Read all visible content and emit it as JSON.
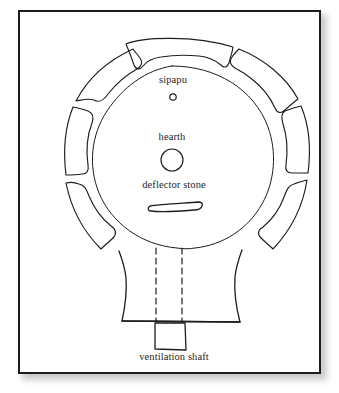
{
  "figure": {
    "kind": "archaeological-floor-plan",
    "background_color": "#ffffff",
    "ink_color": "#1d1d1d",
    "frame_color": "#1d1d1d"
  },
  "labels": {
    "sipapu": "sipapu",
    "hearth": "hearth",
    "deflector_stone": "deflector stone",
    "ventilation_shaft": "ventilation shaft"
  },
  "features": [
    {
      "id": "sipapu",
      "label": "sipapu",
      "shape": "small-circle",
      "cx": 173,
      "cy": 97,
      "r": 3
    },
    {
      "id": "hearth",
      "label": "hearth",
      "shape": "circle",
      "cx": 172,
      "cy": 160,
      "r": 11
    },
    {
      "id": "deflector-stone",
      "label": "deflector stone",
      "shape": "elongated-slab",
      "cx": 173,
      "cy": 201
    },
    {
      "id": "ventilation-shaft",
      "label": "ventilation shaft",
      "shape": "rectangle",
      "cx": 174,
      "cy": 337
    }
  ],
  "structure": {
    "inner_chamber": "circular kiva chamber",
    "outer_ring": "banquette ring with six recesses",
    "recess_count": 6,
    "antechamber": "trapezoidal recess south of chamber",
    "shaft_guides": "dashed vertical lines"
  }
}
